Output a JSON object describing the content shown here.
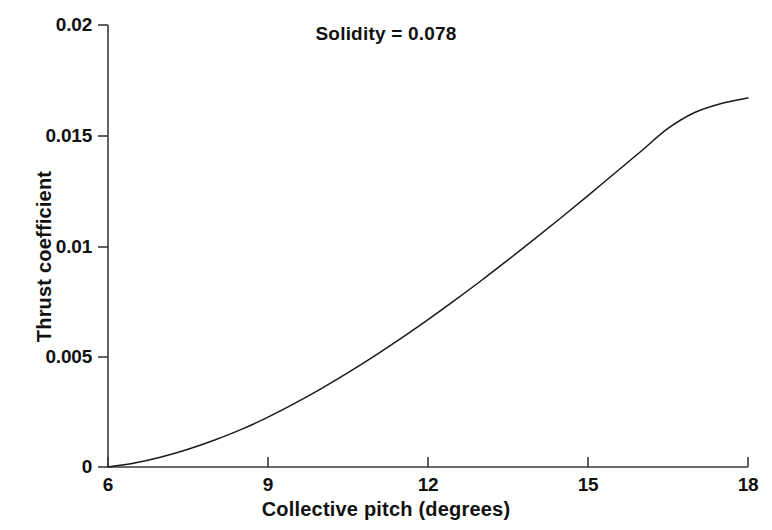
{
  "chart_data": {
    "type": "line",
    "title": "Solidity = 0.078",
    "xlabel": "Collective pitch (degrees)",
    "ylabel": "Thrust coefficient",
    "xlim": [
      6,
      18
    ],
    "ylim": [
      0,
      0.02
    ],
    "xticks": [
      6,
      9,
      12,
      15,
      18
    ],
    "xtick_labels": [
      "6",
      "9",
      "12",
      "15",
      "18"
    ],
    "yticks": [
      0,
      0.005,
      0.01,
      0.015,
      0.02
    ],
    "ytick_labels": [
      "0",
      "0.005",
      "0.01",
      "0.015",
      "0.02"
    ],
    "grid": false,
    "legend": false,
    "series": [
      {
        "name": "Thrust coefficient vs collective pitch",
        "color": "#1a1a1a",
        "x": [
          6.0,
          6.5,
          7.0,
          7.5,
          8.0,
          8.5,
          9.0,
          9.5,
          10.0,
          10.5,
          11.0,
          11.5,
          12.0,
          12.5,
          13.0,
          13.5,
          14.0,
          14.5,
          15.0,
          15.5,
          16.0,
          16.5,
          17.0,
          17.5,
          18.0
        ],
        "values": [
          0.0,
          0.00018,
          0.00045,
          0.0008,
          0.00122,
          0.0017,
          0.00226,
          0.00288,
          0.00355,
          0.00427,
          0.00503,
          0.00583,
          0.00667,
          0.00754,
          0.00844,
          0.00937,
          0.01032,
          0.01129,
          0.01228,
          0.01329,
          0.0143,
          0.01532,
          0.01604,
          0.01645,
          0.0167
        ]
      }
    ],
    "annotations": []
  },
  "axis_colors": {
    "axis_line": "#3a3a3a",
    "curve": "#1a1a1a",
    "background": "#ffffff"
  }
}
